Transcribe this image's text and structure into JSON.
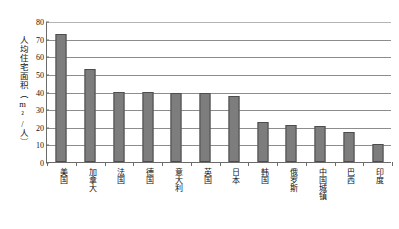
{
  "chart_data": {
    "type": "bar",
    "title": "",
    "xlabel": "",
    "ylabel": "人均住宅面积（m²/人）",
    "ylim": [
      0,
      80
    ],
    "ytick_values": [
      0,
      10,
      20,
      30,
      40,
      50,
      60,
      70,
      80
    ],
    "ytick_labels": [
      "0",
      "10",
      "20",
      "30",
      "40",
      "50",
      "60",
      "70",
      "80"
    ],
    "grid": true,
    "legend": "none",
    "categories": [
      "美国",
      "加拿大",
      "法国",
      "德国",
      "意大利",
      "英国",
      "日本",
      "韩国",
      "俄罗斯",
      "中国城镇",
      "巴西",
      "印度"
    ],
    "values": [
      72.8,
      52.5,
      40.0,
      40.0,
      39.0,
      39.0,
      37.5,
      22.5,
      21.0,
      20.5,
      17.0,
      10.0
    ],
    "series": [
      {
        "name": "人均住宅面积",
        "values": [
          72.8,
          52.5,
          40.0,
          40.0,
          39.0,
          39.0,
          37.5,
          22.5,
          21.0,
          20.5,
          17.0,
          10.0
        ]
      }
    ],
    "colors": {
      "bar_fill": "#7d7d7d",
      "bar_border": "#4d4d4d",
      "grid": "#8d8d8d",
      "axis": "#6b6b6b",
      "text": "#111111",
      "background": "#ffffff"
    }
  }
}
